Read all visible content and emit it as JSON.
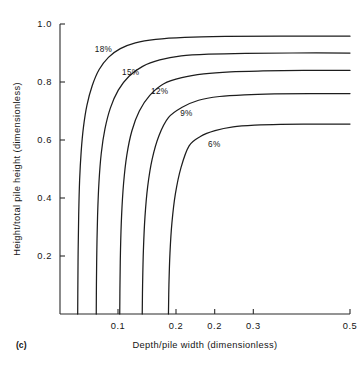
{
  "figure": {
    "panel_tag": "(c)",
    "background": "#ffffff",
    "ink_color": "#1d1d1d"
  },
  "chart_data": {
    "type": "line",
    "title": "",
    "xlabel": "Depth/pile width  (dimensionless)",
    "ylabel": "Height/total pile height (dimensionless)",
    "xlim": [
      0.0,
      0.5
    ],
    "ylim": [
      0.0,
      1.0
    ],
    "grid": false,
    "legend": "inline-curve-labels",
    "xticks": [
      0.1,
      0.2,
      0.2,
      0.3,
      0.5
    ],
    "xticklabels": [
      "0.1",
      "0.2",
      "0.2",
      "0.3",
      "0.5"
    ],
    "yticks": [
      0.2,
      0.4,
      0.6,
      0.8,
      1.0
    ],
    "yticklabels": [
      "0.2",
      "0.4",
      "0.6",
      "0.8",
      "1.0"
    ],
    "series": [
      {
        "name": "18%",
        "label": "18%",
        "label_x": 0.075,
        "label_y": 0.905,
        "asymptote_x": 0.035,
        "plateau_y": 0.958,
        "points": [
          [
            0.0305,
            0.0
          ],
          [
            0.0308,
            0.1
          ],
          [
            0.0313,
            0.22
          ],
          [
            0.0322,
            0.34
          ],
          [
            0.0338,
            0.46
          ],
          [
            0.0365,
            0.56
          ],
          [
            0.0405,
            0.645
          ],
          [
            0.0465,
            0.72
          ],
          [
            0.0555,
            0.787
          ],
          [
            0.0675,
            0.843
          ],
          [
            0.0835,
            0.885
          ],
          [
            0.104,
            0.915
          ],
          [
            0.13,
            0.935
          ],
          [
            0.165,
            0.947
          ],
          [
            0.215,
            0.954
          ],
          [
            0.285,
            0.957
          ],
          [
            0.38,
            0.958
          ],
          [
            0.5,
            0.958
          ]
        ]
      },
      {
        "name": "15%",
        "label": "15%",
        "label_x": 0.122,
        "label_y": 0.825,
        "asymptote_x": 0.065,
        "plateau_y": 0.9,
        "points": [
          [
            0.0625,
            0.0
          ],
          [
            0.0628,
            0.1
          ],
          [
            0.0635,
            0.22
          ],
          [
            0.0648,
            0.34
          ],
          [
            0.0672,
            0.455
          ],
          [
            0.0712,
            0.555
          ],
          [
            0.0775,
            0.638
          ],
          [
            0.0868,
            0.71
          ],
          [
            0.1005,
            0.772
          ],
          [
            0.119,
            0.82
          ],
          [
            0.1425,
            0.854
          ],
          [
            0.172,
            0.876
          ],
          [
            0.209,
            0.89
          ],
          [
            0.256,
            0.896
          ],
          [
            0.32,
            0.899
          ],
          [
            0.4,
            0.9
          ],
          [
            0.5,
            0.9
          ]
        ]
      },
      {
        "name": "12%",
        "label": "12%",
        "label_x": 0.172,
        "label_y": 0.76,
        "asymptote_x": 0.105,
        "plateau_y": 0.84,
        "points": [
          [
            0.103,
            0.0
          ],
          [
            0.1034,
            0.1
          ],
          [
            0.1043,
            0.22
          ],
          [
            0.1062,
            0.34
          ],
          [
            0.1096,
            0.45
          ],
          [
            0.1152,
            0.548
          ],
          [
            0.124,
            0.632
          ],
          [
            0.1368,
            0.7
          ],
          [
            0.1548,
            0.754
          ],
          [
            0.179,
            0.794
          ],
          [
            0.21,
            0.815
          ],
          [
            0.248,
            0.828
          ],
          [
            0.294,
            0.835
          ],
          [
            0.35,
            0.838
          ],
          [
            0.42,
            0.84
          ],
          [
            0.5,
            0.84
          ]
        ]
      },
      {
        "name": "9%",
        "label": "9%",
        "label_x": 0.218,
        "label_y": 0.682,
        "asymptote_x": 0.145,
        "plateau_y": 0.76,
        "points": [
          [
            0.1418,
            0.0
          ],
          [
            0.1424,
            0.1
          ],
          [
            0.1438,
            0.22
          ],
          [
            0.1465,
            0.335
          ],
          [
            0.1512,
            0.44
          ],
          [
            0.159,
            0.535
          ],
          [
            0.1706,
            0.615
          ],
          [
            0.1872,
            0.678
          ],
          [
            0.2098,
            0.712
          ],
          [
            0.239,
            0.737
          ],
          [
            0.275,
            0.75
          ],
          [
            0.318,
            0.756
          ],
          [
            0.37,
            0.759
          ],
          [
            0.432,
            0.76
          ],
          [
            0.5,
            0.76
          ]
        ]
      },
      {
        "name": "6%",
        "label": "6%",
        "label_x": 0.266,
        "label_y": 0.575,
        "asymptote_x": 0.19,
        "plateau_y": 0.655,
        "points": [
          [
            0.187,
            0.0
          ],
          [
            0.1878,
            0.1
          ],
          [
            0.1896,
            0.21
          ],
          [
            0.193,
            0.315
          ],
          [
            0.199,
            0.415
          ],
          [
            0.2086,
            0.505
          ],
          [
            0.2226,
            0.58
          ],
          [
            0.242,
            0.612
          ],
          [
            0.2672,
            0.632
          ],
          [
            0.2985,
            0.645
          ],
          [
            0.336,
            0.651
          ],
          [
            0.38,
            0.654
          ],
          [
            0.44,
            0.655
          ],
          [
            0.5,
            0.655
          ]
        ]
      }
    ]
  }
}
